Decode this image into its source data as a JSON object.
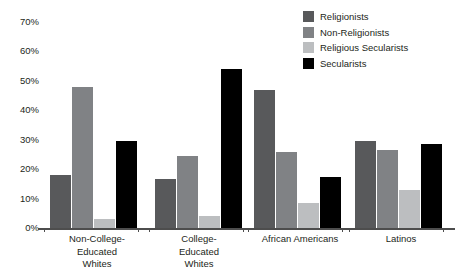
{
  "chart_data": {
    "type": "bar",
    "title": "",
    "subtitle": "",
    "xlabel": "",
    "ylabel": "",
    "ylim": [
      0,
      70
    ],
    "ytick_labels": [
      "0%",
      "10%",
      "20%",
      "30%",
      "40%",
      "50%",
      "60%",
      "70%"
    ],
    "ytick_values": [
      0,
      10,
      20,
      30,
      40,
      50,
      60,
      70
    ],
    "grid": false,
    "legend_position": "top-right",
    "categories": [
      "Non-College-\nEducated\nWhites",
      "College-\nEducated\nWhites",
      "African Americans",
      "Latinos"
    ],
    "series": [
      {
        "name": "Religionists",
        "color": "#58595b",
        "values": [
          18,
          16.5,
          47,
          29.5
        ]
      },
      {
        "name": "Non-Religionists",
        "color": "#808285",
        "values": [
          48,
          24.5,
          26,
          26.5
        ]
      },
      {
        "name": "Religious Secularists",
        "color": "#bcbec0",
        "values": [
          3,
          4,
          8.5,
          13
        ]
      },
      {
        "name": "Secularists",
        "color": "#000000",
        "values": [
          29.5,
          54,
          17.5,
          28.5
        ]
      }
    ]
  },
  "legend": {
    "items": [
      {
        "label": "Religionists",
        "color": "#58595b"
      },
      {
        "label": "Non-Religionists",
        "color": "#808285"
      },
      {
        "label": "Religious Secularists",
        "color": "#bcbec0"
      },
      {
        "label": "Secularists",
        "color": "#000000"
      }
    ]
  },
  "axis": {
    "color": "#4d4d4d"
  }
}
